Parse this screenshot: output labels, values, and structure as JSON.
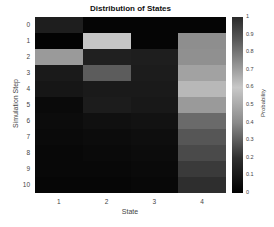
{
  "chart_data": {
    "type": "heatmap",
    "title": "Distribution of States",
    "xlabel": "State",
    "ylabel": "Simulation Step",
    "colorbar_label": "Probability",
    "x_categories": [
      "1",
      "2",
      "3",
      "4"
    ],
    "y_categories": [
      "0",
      "1",
      "2",
      "3",
      "4",
      "5",
      "6",
      "7",
      "8",
      "9",
      "10"
    ],
    "colorbar_ticks": [
      "1",
      "0.9",
      "0.8",
      "0.7",
      "0.6",
      "0.5",
      "0.4",
      "0.3",
      "0.2",
      "0.1",
      "0"
    ],
    "clim": [
      0,
      1
    ],
    "values": [
      [
        1.0,
        0.0,
        0.0,
        0.0
      ],
      [
        0.0,
        0.6,
        0.0,
        0.4
      ],
      [
        0.42,
        0.15,
        0.06,
        0.37
      ],
      [
        0.12,
        0.3,
        0.12,
        0.46
      ],
      [
        0.1,
        0.11,
        0.11,
        0.68
      ],
      [
        0.05,
        0.11,
        0.1,
        0.74
      ],
      [
        0.04,
        0.05,
        0.06,
        0.85
      ],
      [
        0.03,
        0.03,
        0.04,
        0.9
      ],
      [
        0.02,
        0.02,
        0.03,
        0.93
      ],
      [
        0.01,
        0.01,
        0.02,
        0.96
      ],
      [
        0.01,
        0.01,
        0.01,
        0.97
      ]
    ],
    "cell_colors": [
      [
        "#1e1e1e",
        "#050505",
        "#050505",
        "#050505"
      ],
      [
        "#030303",
        "#c6c6c6",
        "#050505",
        "#8e8e8e"
      ],
      [
        "#9a9a9a",
        "#202020",
        "#1e1e1e",
        "#909090"
      ],
      [
        "#1a1a1a",
        "#5c5c5c",
        "#1c1c1c",
        "#a2a2a2"
      ],
      [
        "#161616",
        "#1a1a1a",
        "#1a1a1a",
        "#b8b8b8"
      ],
      [
        "#0a0a0a",
        "#1c1c1c",
        "#181818",
        "#9a9a9a"
      ],
      [
        "#0c0c0c",
        "#101010",
        "#121212",
        "#6a6a6a"
      ],
      [
        "#0a0a0a",
        "#0c0c0c",
        "#0e0e0e",
        "#565656"
      ],
      [
        "#080808",
        "#0a0a0a",
        "#0c0c0c",
        "#4a4a4a"
      ],
      [
        "#080808",
        "#080808",
        "#0a0a0a",
        "#3a3a3a"
      ],
      [
        "#060606",
        "#060606",
        "#080808",
        "#2e2e2e"
      ]
    ]
  }
}
